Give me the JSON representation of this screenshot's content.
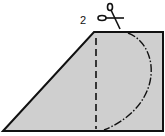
{
  "diagram": {
    "step_label": "2",
    "shape": "trapezoid",
    "fill_color": "#cfcfcf",
    "stroke_color": "#111111",
    "icons": [
      "scissors-icon"
    ],
    "lines": [
      {
        "type": "fold",
        "style": "dashed",
        "orientation": "vertical"
      },
      {
        "type": "cut",
        "style": "dash-dot",
        "shape": "semicircle-arc"
      }
    ]
  }
}
